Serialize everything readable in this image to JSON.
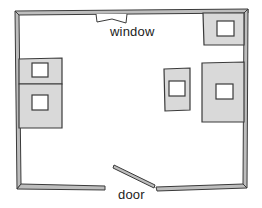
{
  "diagram": {
    "type": "floor-plan",
    "labels": {
      "window": "window",
      "door": "door"
    },
    "colors": {
      "wall_fill": "#bdbdbd",
      "outline": "#3a3a3a",
      "furniture_fill": "#d9d9d9",
      "background": "#ffffff"
    },
    "furniture": [
      {
        "id": "left-upper",
        "x": 19,
        "y": 59,
        "w": 43,
        "h": 25
      },
      {
        "id": "left-lower",
        "x": 19,
        "y": 84,
        "w": 43,
        "h": 44
      },
      {
        "id": "top-right",
        "x": 203,
        "y": 13,
        "w": 41,
        "h": 32
      },
      {
        "id": "middle-right",
        "x": 164,
        "y": 68,
        "w": 26,
        "h": 43
      },
      {
        "id": "right-large",
        "x": 202,
        "y": 62,
        "w": 42,
        "h": 60
      }
    ]
  }
}
